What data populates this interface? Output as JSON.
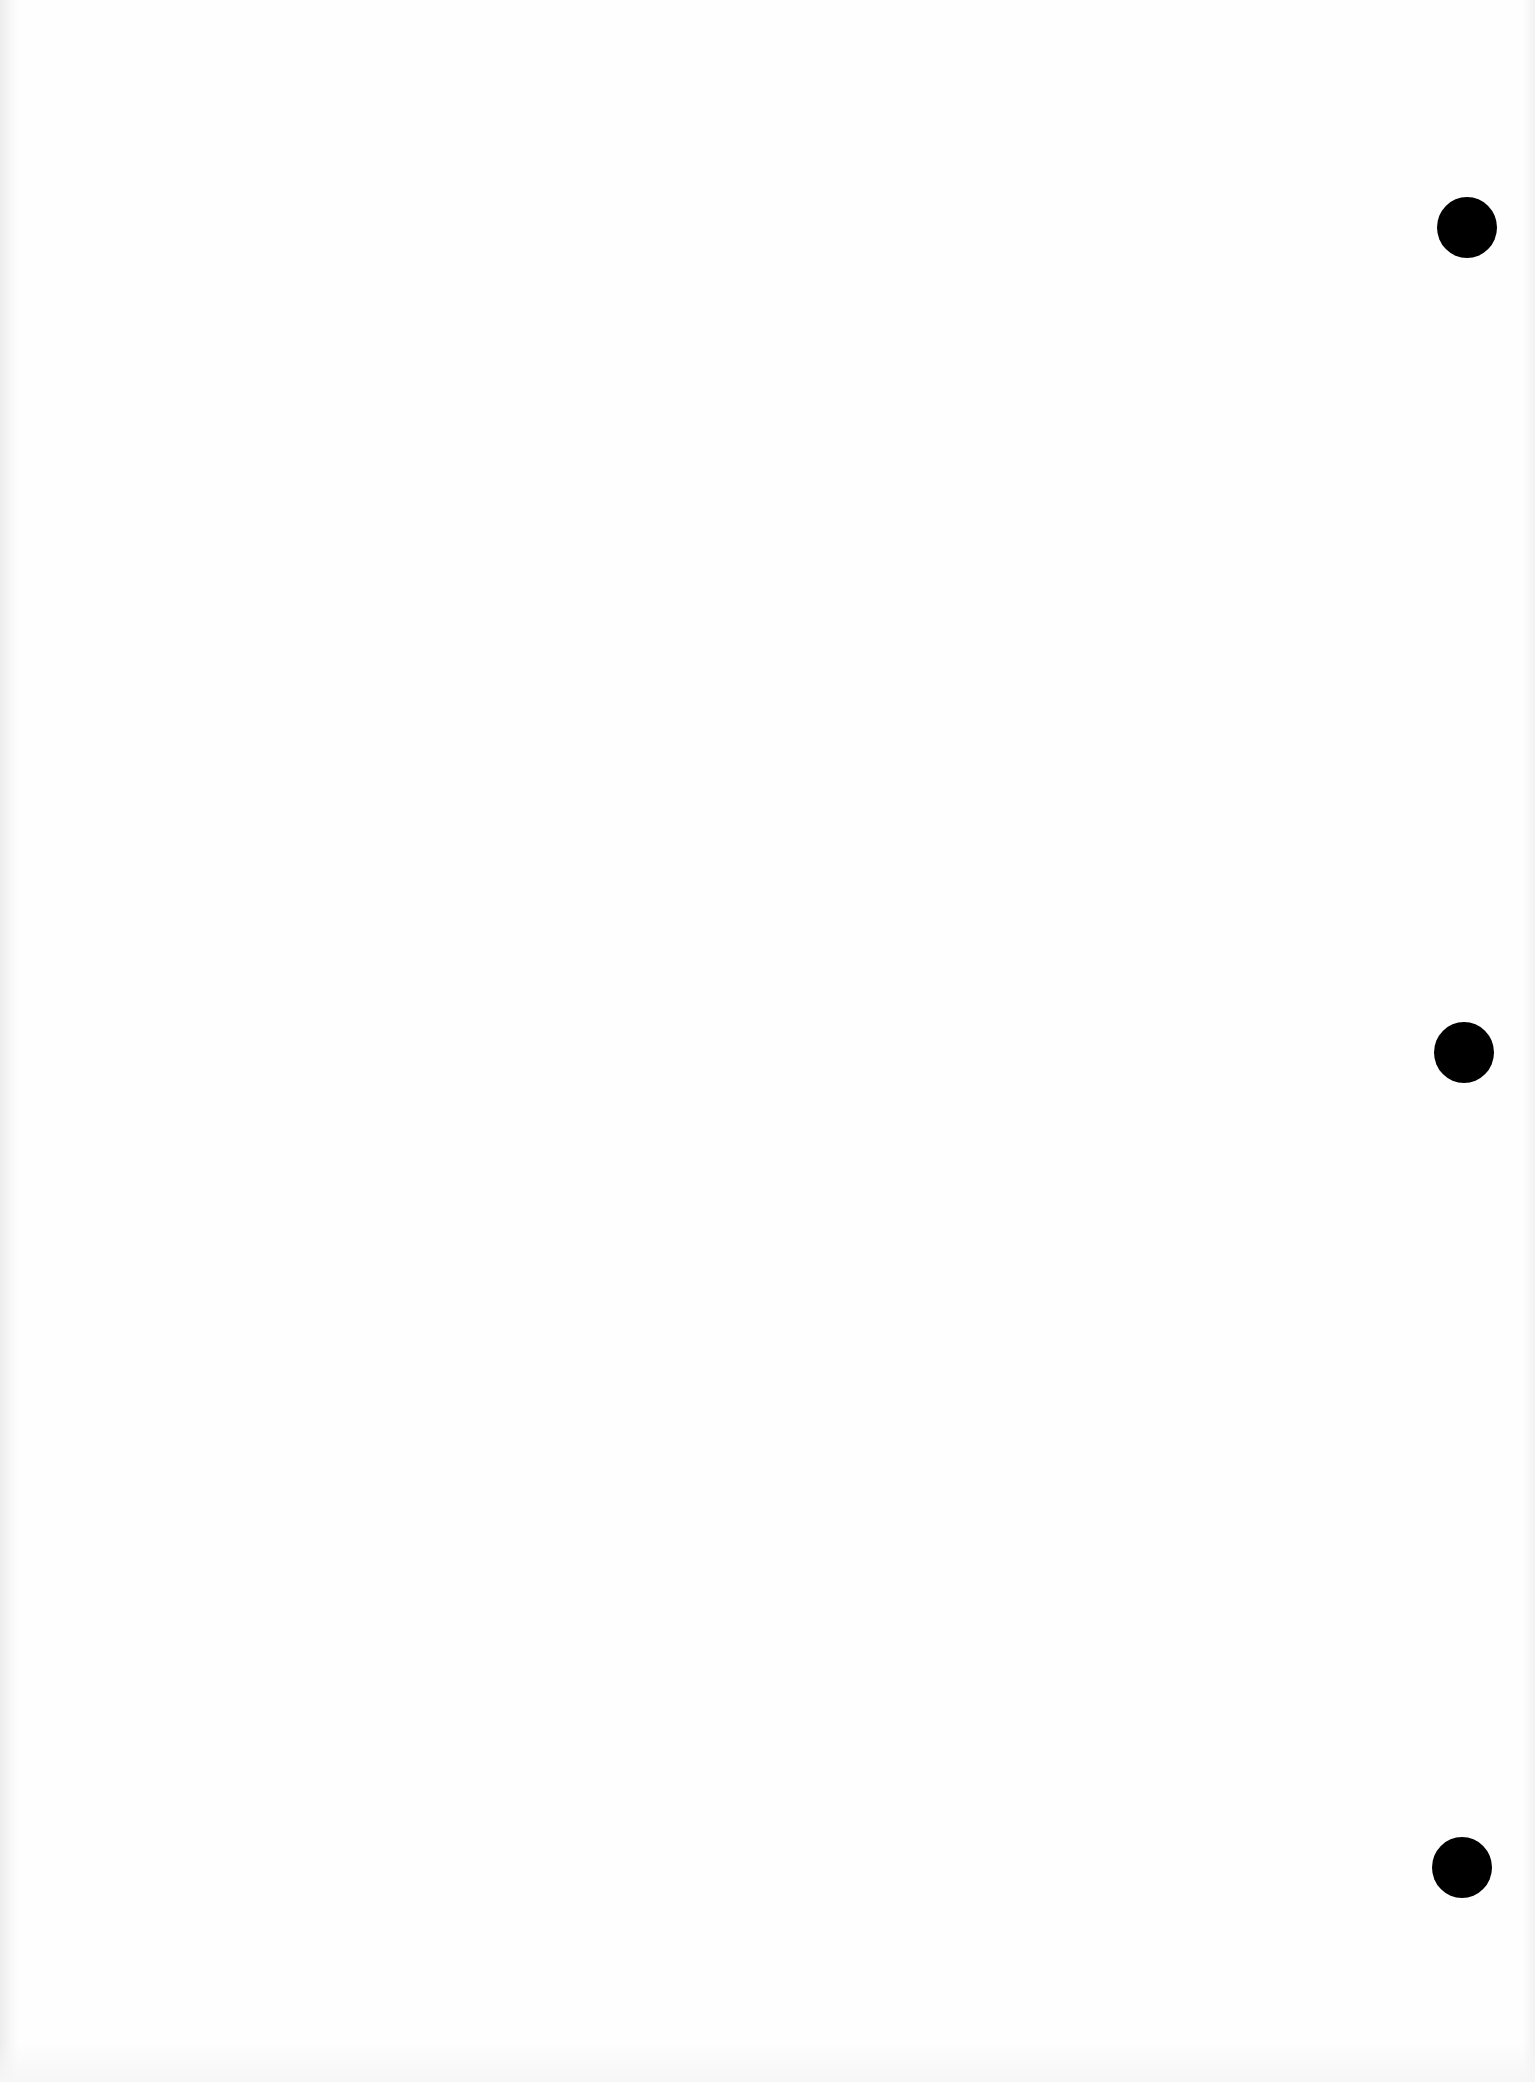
{
  "document": {
    "type": "blank scanned page",
    "background_color": "#fefefe",
    "text_content": ""
  },
  "punch_holes": [
    {
      "position": "top",
      "color": "#000000"
    },
    {
      "position": "middle",
      "color": "#000000"
    },
    {
      "position": "bottom",
      "color": "#000000"
    }
  ]
}
